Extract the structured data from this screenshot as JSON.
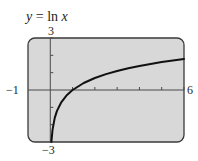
{
  "chart_data": {
    "type": "line",
    "title": "y = ln x",
    "title_parts": {
      "var": "y",
      "eq": " = ",
      "fn": "ln ",
      "arg": "x"
    },
    "series": [
      {
        "name": "y = ln x",
        "x": [
          0.05,
          0.1,
          0.2,
          0.3,
          0.5,
          0.75,
          1,
          1.5,
          2,
          2.5,
          3,
          3.5,
          4,
          4.5,
          5,
          5.5,
          6
        ],
        "y": [
          -3.0,
          -2.303,
          -1.609,
          -1.204,
          -0.693,
          -0.288,
          0,
          0.405,
          0.693,
          0.916,
          1.099,
          1.253,
          1.386,
          1.504,
          1.609,
          1.705,
          1.792
        ]
      }
    ],
    "xlabel": "",
    "ylabel": "",
    "xlim": [
      -1,
      6
    ],
    "ylim": [
      -3,
      3
    ],
    "xticks": [
      1,
      2,
      3,
      4,
      5,
      6
    ],
    "yticks": [
      -2,
      -1,
      1,
      2,
      3
    ],
    "window_labels": {
      "xmin": "−1",
      "xmax": "6",
      "ymin": "−3",
      "ymax": "3"
    },
    "grid": false,
    "legend": "none",
    "colors": {
      "background": "#d8d8d8",
      "frame": "#3a3a3a",
      "curve": "#111111",
      "axis": "#4a4a4a"
    }
  }
}
